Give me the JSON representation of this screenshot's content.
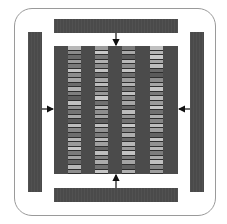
{
  "diagram": {
    "colors": {
      "frame_border": "#9a9a9a",
      "bar_fill": "#4a4a4a",
      "core_fill": "#4b4b4b",
      "arrow": "#111111"
    },
    "bars": [
      {
        "id": "top",
        "arrow": "down"
      },
      {
        "id": "bottom",
        "arrow": "up"
      },
      {
        "id": "left",
        "arrow": "right"
      },
      {
        "id": "right",
        "arrow": "left"
      }
    ],
    "columns": [
      {
        "x": 14,
        "stripes": [
          "#b8b8b8",
          "#8a8a8a",
          "#6a6a6a",
          "#9c9c9c",
          "#7a7a7a",
          "#c4c4c4",
          "#8c8c8c",
          "#a6a6a6",
          "#6c6c6c",
          "#b0b0b0",
          "#7e7e7e",
          "#5e5e5e",
          "#c0c0c0",
          "#939393",
          "#747474",
          "#a9a9a9",
          "#5a5a5a",
          "#bcbcbc",
          "#888888",
          "#6e6e6e",
          "#b4b4b4",
          "#9a9a9a",
          "#c6c6c6",
          "#7a7a7a",
          "#a2a2a2",
          "#686868",
          "#b8b8b8",
          "#8e8e8e"
        ]
      },
      {
        "x": 41,
        "stripes": [
          "#9c9c9c",
          "#c8c8c8",
          "#7a7a7a",
          "#b0b0b0",
          "#8a8a8a",
          "#c2c2c2",
          "#6a6a6a",
          "#a8a8a8",
          "#bdbdbd",
          "#7c7c7c",
          "#989898",
          "#c6c6c6",
          "#707070",
          "#b4b4b4",
          "#8e8e8e",
          "#a4a4a4",
          "#5e5e5e",
          "#c0c0c0",
          "#929292",
          "#7a7a7a",
          "#b8b8b8",
          "#a0a0a0",
          "#686868",
          "#bebebe",
          "#848484",
          "#acacac",
          "#727272",
          "#c4c4c4"
        ]
      },
      {
        "x": 68,
        "stripes": [
          "#7a7a7a",
          "#a8a8a8",
          "#5c5c5c",
          "#b8b8b8",
          "#8c8c8c",
          "#c4c4c4",
          "#6e6e6e",
          "#9e9e9e",
          "#b2b2b2",
          "#787878",
          "#c0c0c0",
          "#8a8a8a",
          "#a6a6a6",
          "#646464",
          "#bcbcbc",
          "#949494",
          "#727272",
          "#c6c6c6",
          "#868686",
          "#aeaeae",
          "#6a6a6a",
          "#b6b6b6",
          "#9a9a9a",
          "#c2c2c2",
          "#7e7e7e",
          "#a4a4a4",
          "#606060",
          "#b0b0b0"
        ]
      },
      {
        "x": 96,
        "stripes": [
          "#c0c0c0",
          "#b4b4b4",
          "#c8c8c8",
          "#a8a8a8",
          "#bebebe",
          "#6a6a6a",
          "#5a5a5a",
          "#8e8e8e",
          "#a6a6a6",
          "#c4c4c4",
          "#7a7a7a",
          "#b8b8b8",
          "#9a9a9a",
          "#c6c6c6",
          "#707070",
          "#b0b0b0",
          "#868686",
          "#bcbcbc",
          "#a0a0a0",
          "#646464",
          "#c2c2c2",
          "#929292",
          "#b6b6b6",
          "#7c7c7c",
          "#aaaaaa",
          "#c0c0c0",
          "#888888",
          "#9e9e9e"
        ]
      }
    ]
  }
}
